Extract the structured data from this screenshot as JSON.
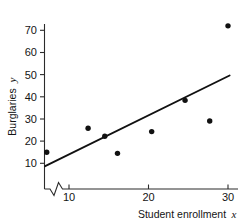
{
  "chart_data": {
    "type": "scatter",
    "title": "",
    "subtitle": "",
    "xlabel": "Student enrollment",
    "xlabel_variable": "x",
    "ylabel": "Burglaries",
    "ylabel_variable": "y",
    "xlim": [
      6.5,
      31
    ],
    "ylim": [
      5,
      76
    ],
    "grid": false,
    "legend": null,
    "axis_break_x": true,
    "x_ticks": [
      10,
      20,
      30
    ],
    "x_tick_labels": [
      "10",
      "20",
      "30"
    ],
    "y_ticks": [
      10,
      20,
      30,
      40,
      50,
      60,
      70
    ],
    "y_tick_labels": [
      "10",
      "20",
      "30",
      "40",
      "50",
      "60",
      "70"
    ],
    "points": [
      {
        "x": 7.2,
        "y": 15.0
      },
      {
        "x": 12.4,
        "y": 25.8
      },
      {
        "x": 14.5,
        "y": 22.2
      },
      {
        "x": 16.1,
        "y": 14.5
      },
      {
        "x": 20.4,
        "y": 24.3
      },
      {
        "x": 24.6,
        "y": 38.4
      },
      {
        "x": 27.7,
        "y": 29.1
      },
      {
        "x": 30.0,
        "y": 72.0
      }
    ],
    "series": [
      {
        "name": "Burglaries vs enrollment",
        "marker": "filled-circle",
        "color": "#111111",
        "x": [
          7.2,
          12.4,
          14.5,
          16.1,
          20.4,
          24.6,
          27.7,
          30.0
        ],
        "values": [
          15.0,
          25.8,
          22.2,
          14.5,
          24.3,
          38.4,
          29.1,
          72.0
        ]
      }
    ],
    "fit_line": {
      "name": "least-squares regression line",
      "x_start": 7.0,
      "y_start": 8.7,
      "x_end": 30.2,
      "y_end": 49.6,
      "color": "#111111"
    },
    "colors": {
      "point": "#111111",
      "line": "#111111",
      "axis": "#2b2b2b",
      "text": "#141414",
      "background": "#ffffff"
    }
  }
}
